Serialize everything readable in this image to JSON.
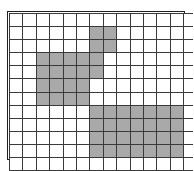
{
  "figure": {
    "name": "shaded-grid-figure",
    "width": 193,
    "height": 171,
    "background_color": "#ffffff"
  },
  "grid": {
    "columns": 14,
    "rows": 12,
    "origin_x": 9,
    "origin_y": 13,
    "cell_width": 12.4,
    "cell_height": 12.1,
    "border_color": "#231f20",
    "line_color": "#3a3a3a",
    "empty_color": "#ffffff",
    "filled_color": "#a9a9a9",
    "filled_cells": [
      [
        1,
        6
      ],
      [
        1,
        7
      ],
      [
        2,
        6
      ],
      [
        2,
        7
      ],
      [
        3,
        2
      ],
      [
        3,
        3
      ],
      [
        3,
        4
      ],
      [
        3,
        5
      ],
      [
        3,
        6
      ],
      [
        4,
        2
      ],
      [
        4,
        3
      ],
      [
        4,
        4
      ],
      [
        4,
        5
      ],
      [
        4,
        6
      ],
      [
        5,
        2
      ],
      [
        5,
        3
      ],
      [
        5,
        4
      ],
      [
        5,
        5
      ],
      [
        6,
        2
      ],
      [
        6,
        3
      ],
      [
        6,
        4
      ],
      [
        6,
        5
      ],
      [
        7,
        6
      ],
      [
        7,
        7
      ],
      [
        7,
        8
      ],
      [
        7,
        9
      ],
      [
        7,
        10
      ],
      [
        7,
        11
      ],
      [
        7,
        12
      ],
      [
        8,
        6
      ],
      [
        8,
        7
      ],
      [
        8,
        8
      ],
      [
        8,
        9
      ],
      [
        8,
        10
      ],
      [
        8,
        11
      ],
      [
        8,
        12
      ],
      [
        9,
        6
      ],
      [
        9,
        7
      ],
      [
        9,
        8
      ],
      [
        9,
        9
      ],
      [
        9,
        10
      ],
      [
        9,
        11
      ],
      [
        9,
        12
      ],
      [
        10,
        6
      ],
      [
        10,
        7
      ],
      [
        10,
        8
      ],
      [
        10,
        9
      ],
      [
        10,
        10
      ],
      [
        10,
        11
      ],
      [
        10,
        12
      ]
    ]
  }
}
